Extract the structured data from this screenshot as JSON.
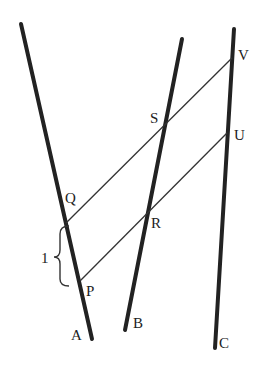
{
  "diagram": {
    "lines": [
      {
        "name": "A",
        "label": "A",
        "x1": 21,
        "y1": 24,
        "x2": 92,
        "y2": 339
      },
      {
        "name": "B",
        "label": "B",
        "x1": 182,
        "y1": 39,
        "x2": 125,
        "y2": 330
      },
      {
        "name": "C",
        "label": "C",
        "x1": 234,
        "y1": 29,
        "x2": 215,
        "y2": 348
      }
    ],
    "parallels": [
      {
        "name": "QV",
        "from": "Q",
        "to": "V",
        "x1": 66,
        "y1": 223,
        "x2": 232,
        "y2": 58
      },
      {
        "name": "PU",
        "from": "P",
        "to": "U",
        "x1": 80,
        "y1": 281,
        "x2": 227,
        "y2": 133
      }
    ],
    "points": {
      "V": {
        "label": "V",
        "lx": 240,
        "ly": 60
      },
      "S": {
        "label": "S",
        "lx": 150,
        "ly": 122
      },
      "U": {
        "label": "U",
        "lx": 235,
        "ly": 140
      },
      "Q": {
        "label": "Q",
        "lx": 65,
        "ly": 203
      },
      "R": {
        "label": "R",
        "lx": 151,
        "ly": 228
      },
      "P": {
        "label": "P",
        "lx": 86,
        "ly": 297
      }
    },
    "line_labels": {
      "A": {
        "label": "A",
        "lx": 72,
        "ly": 340
      },
      "B": {
        "label": "B",
        "lx": 133,
        "ly": 328
      },
      "C": {
        "label": "C",
        "lx": 218,
        "ly": 348
      }
    },
    "brace": {
      "label": "1",
      "from": "Q",
      "to": "P"
    },
    "colors": {
      "thick": "#222222",
      "thin": "#333333",
      "text": "#222222"
    }
  }
}
